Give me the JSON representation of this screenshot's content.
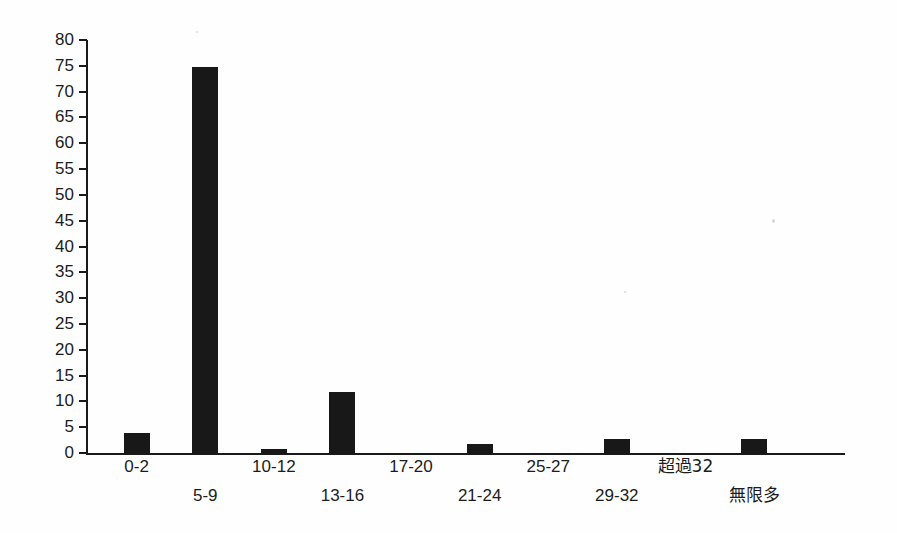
{
  "chart_data": {
    "type": "bar",
    "title": "",
    "subtitle": "",
    "xlabel": "",
    "ylabel": "",
    "categories": [
      "0-2",
      "5-9",
      "10-12",
      "13-16",
      "17-20",
      "21-24",
      "25-27",
      "29-32",
      "超過32",
      "無限多"
    ],
    "values": [
      4,
      75,
      1,
      12,
      0,
      2,
      0,
      3,
      0,
      3
    ],
    "ylim": [
      0,
      80
    ],
    "ytick_step": 5,
    "yticks": [
      "80",
      "75",
      "70",
      "65",
      "60",
      "55",
      "50",
      "45",
      "40",
      "35",
      "30",
      "25",
      "20",
      "15",
      "10",
      "5",
      "0"
    ],
    "grid": false,
    "legend": false,
    "bar_color": "#181818",
    "axis_color": "#1a1a1a",
    "background_color": "#fefefe",
    "label_rows": "alternating",
    "xtick_labels_upper": [
      "0-2",
      "10-12",
      "17-20",
      "25-27",
      "超過32"
    ],
    "xtick_labels_lower": [
      "5-9",
      "13-16",
      "21-24",
      "29-32",
      "無限多"
    ]
  },
  "axis": {
    "y_max_label": "80",
    "y_min_label": "0"
  }
}
